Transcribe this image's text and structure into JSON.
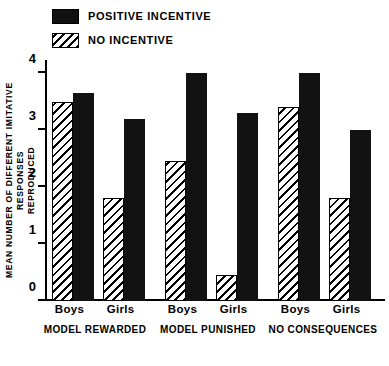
{
  "legend": {
    "items": [
      {
        "label": "POSITIVE INCENTIVE",
        "pattern": "solid",
        "color": "#121212"
      },
      {
        "label": "NO INCENTIVE",
        "pattern": "hatch",
        "color": "#000000"
      }
    ]
  },
  "axes": {
    "y_title": "MEAN NUMBER OF DIFFERENT IMITATIVE RESPONSES\nREPRODUCED",
    "y_ticks": [
      "0",
      "1",
      "2",
      "3",
      "4"
    ]
  },
  "groups": [
    {
      "condition": "MODEL REWARDED",
      "boys_label": "Boys",
      "girls_label": "Girls"
    },
    {
      "condition": "MODEL PUNISHED",
      "boys_label": "Boys",
      "girls_label": "Girls"
    },
    {
      "condition": "NO CONSEQUENCES",
      "boys_label": "Boys",
      "girls_label": "Girls"
    }
  ],
  "chart_data": {
    "type": "bar",
    "title": "",
    "xlabel": "",
    "ylabel": "MEAN NUMBER OF DIFFERENT IMITATIVE RESPONSES REPRODUCED",
    "ylim": [
      0,
      4.3
    ],
    "yticks": [
      0,
      1,
      2,
      3,
      4
    ],
    "grid": false,
    "legend_position": "top-left",
    "categories": [
      "Boys / MODEL REWARDED",
      "Girls / MODEL REWARDED",
      "Boys / MODEL PUNISHED",
      "Girls / MODEL PUNISHED",
      "Boys / NO CONSEQUENCES",
      "Girls / NO CONSEQUENCES"
    ],
    "series": [
      {
        "name": "NO INCENTIVE",
        "pattern": "hatch",
        "values": [
          3.5,
          1.8,
          2.45,
          0.45,
          3.4,
          1.8
        ]
      },
      {
        "name": "POSITIVE INCENTIVE",
        "pattern": "solid",
        "values": [
          3.65,
          3.2,
          4.0,
          3.3,
          4.0,
          3.0
        ]
      }
    ]
  }
}
